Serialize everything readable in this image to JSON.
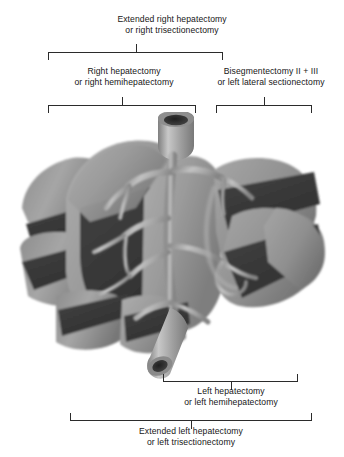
{
  "figure": {
    "background_color": "#ffffff",
    "line_color": "#2b2b2b",
    "text_color": "#161616"
  },
  "annotations": {
    "extended_right": {
      "line1": "Extended right hepatectomy",
      "line2": "or right trisectionectomy"
    },
    "right": {
      "line1": "Right hepatectomy",
      "line2": "or right hemihepatectomy"
    },
    "bisegmentectomy": {
      "line1": "Bisegmentectomy II + III",
      "line2": "or left lateral sectionectomy"
    },
    "left": {
      "line1": "Left hepatectomy",
      "line2": "or left hemihepatectomy"
    },
    "extended_left": {
      "line1": "Extended left hepatectomy",
      "line2": "or left trisectionectomy"
    }
  },
  "illustration": {
    "subject": "three-dimensional liver with segmental resection planes",
    "parenchyma_color": "#9a9a9a",
    "cut_surface_color": "#3b3b3b",
    "vessel_color": "#b0b0b0",
    "lumen_color": "#2e2e2e",
    "superior_vessel": "hepatic vein / inferior vena cava stump",
    "inferior_vessel": "portal vein stump",
    "vascular_tree": "intrahepatic portal and hepatic venous branches"
  }
}
